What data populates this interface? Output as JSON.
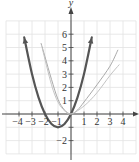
{
  "chart_data": {
    "type": "line",
    "title": "",
    "xlabel": "",
    "ylabel": "y",
    "xlim": [
      -5,
      5
    ],
    "ylim": [
      -3,
      7
    ],
    "grid": true,
    "x_ticks": [
      -4,
      -3,
      -2,
      -1,
      1,
      2,
      3,
      4
    ],
    "x_tick_labels": [
      "-4",
      "-3",
      "-2",
      "-1",
      "1",
      "2",
      "3",
      "4"
    ],
    "y_ticks": [
      -2,
      -1,
      1,
      2,
      3,
      4,
      5,
      6
    ],
    "y_tick_labels": [
      "-2",
      "-1",
      "1",
      "2",
      "3",
      "4",
      "5",
      "6"
    ],
    "series": [
      {
        "name": "y = x^2 + 2x",
        "color": "#555555",
        "width": 2.2,
        "arrows": true,
        "points": [
          [
            -3.6,
            5.76
          ],
          [
            -3,
            3
          ],
          [
            -2.5,
            1.25
          ],
          [
            -2,
            0
          ],
          [
            -1.5,
            -0.75
          ],
          [
            -1,
            -1
          ],
          [
            -0.5,
            -0.75
          ],
          [
            0,
            0
          ],
          [
            0.5,
            1.25
          ],
          [
            1,
            3
          ],
          [
            1.6,
            5.76
          ]
        ]
      },
      {
        "name": "light curve 1",
        "color": "#aaaaaa",
        "width": 1,
        "arrows": false,
        "points": [
          [
            -2.3,
            5.3
          ],
          [
            -2,
            4.3
          ],
          [
            -1.5,
            2.6
          ],
          [
            -1,
            1.1
          ],
          [
            -0.5,
            0.3
          ],
          [
            0,
            0
          ],
          [
            0.5,
            0.3
          ],
          [
            1,
            0.9
          ],
          [
            2,
            2.2
          ],
          [
            3,
            3.6
          ],
          [
            3.6,
            4.8
          ]
        ]
      },
      {
        "name": "light curve 2",
        "color": "#c4c4c4",
        "width": 1,
        "arrows": false,
        "points": [
          [
            -2.2,
            4.9
          ],
          [
            -1.5,
            2.2
          ],
          [
            -1,
            0.9
          ],
          [
            -0.5,
            0.25
          ],
          [
            0,
            0
          ],
          [
            1,
            0.6
          ],
          [
            2,
            1.6
          ],
          [
            3,
            2.9
          ],
          [
            3.7,
            3.7
          ]
        ]
      }
    ]
  }
}
